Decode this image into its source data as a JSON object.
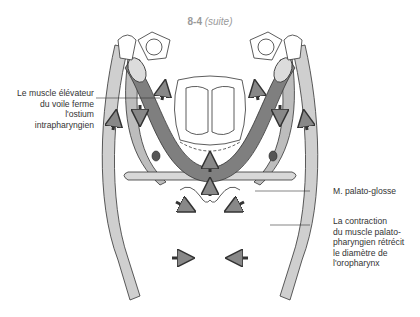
{
  "title": {
    "number": "8-4",
    "suffix": "(suite)"
  },
  "labels": {
    "levator": {
      "lines": [
        "Le muscle élévateur",
        "du voile ferme",
        "l'ostium",
        "intrapharyngien"
      ]
    },
    "palatoglossus": {
      "text": "M. palato-glosse"
    },
    "palatopharyngeus": {
      "lines": [
        "La contraction",
        "du muscle palato-",
        "pharyngien rétrécit",
        "le diamètre de",
        "l'oropharynx"
      ]
    }
  },
  "colors": {
    "dark_muscle": "#7a7a7a",
    "medium_muscle": "#b3b3b3",
    "light_muscle": "#d2d2d2",
    "outline": "#333333",
    "title_text": "#9a9a9a"
  }
}
